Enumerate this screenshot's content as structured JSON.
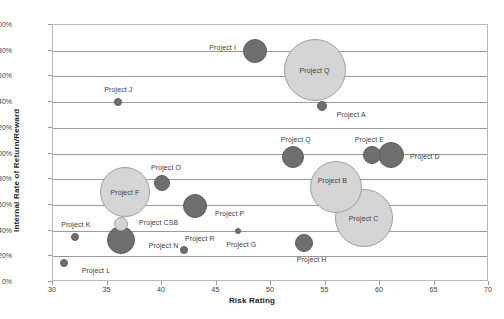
{
  "chart_data": {
    "type": "scatter",
    "title": "",
    "xlabel": "Risk Rating",
    "ylabel": "Internal Rate of Return/Reward",
    "xlim": [
      30,
      70
    ],
    "ylim": [
      0,
      200
    ],
    "xticks": [
      "30",
      "35",
      "40",
      "45",
      "50",
      "55",
      "60",
      "65",
      "70"
    ],
    "yticks": [
      "0%",
      "20%",
      "40%",
      "60%",
      "80%",
      "100%",
      "120%",
      "140%",
      "160%",
      "180%",
      "200%"
    ],
    "grid": "horizontal",
    "legend": "none",
    "colors": {
      "dark_bubble": "#6e6e6e",
      "light_bubble": "#d5d5d5",
      "gridline": "#9a9a9a",
      "frame": "#b9b9b9",
      "text": "#3c3c3c"
    },
    "points": [
      {
        "label": "Project I",
        "x": 48.5,
        "y": 180,
        "size": 24,
        "shade": "dark",
        "label_dx": -32,
        "label_dy": -4
      },
      {
        "label": "Project Q",
        "x": 54.0,
        "y": 165,
        "size": 62,
        "shade": "light",
        "label_dx": 0,
        "label_dy": 0
      },
      {
        "label": "Project J",
        "x": 36.0,
        "y": 140,
        "size": 8,
        "shade": "dark",
        "label_dx": 0,
        "label_dy": -13
      },
      {
        "label": "Project A",
        "x": 54.7,
        "y": 137,
        "size": 10,
        "shade": "dark",
        "label_dx": 29,
        "label_dy": 8
      },
      {
        "label": "Project Q",
        "x": 52.0,
        "y": 97,
        "size": 22,
        "shade": "dark",
        "label_dx": 3,
        "label_dy": -18
      },
      {
        "label": "Project E",
        "x": 59.3,
        "y": 99,
        "size": 18,
        "shade": "dark",
        "label_dx": -3,
        "label_dy": -16
      },
      {
        "label": "Project D",
        "x": 61.0,
        "y": 99,
        "size": 26,
        "shade": "dark",
        "label_dx": 34,
        "label_dy": 1
      },
      {
        "label": "Project B",
        "x": 56.0,
        "y": 74,
        "size": 52,
        "shade": "light",
        "label_dx": -4,
        "label_dy": -7
      },
      {
        "label": "Project C",
        "x": 58.5,
        "y": 50,
        "size": 58,
        "shade": "light",
        "label_dx": 0,
        "label_dy": 0
      },
      {
        "label": "Project F",
        "x": 36.6,
        "y": 70,
        "size": 50,
        "shade": "light",
        "label_dx": 0,
        "label_dy": 0
      },
      {
        "label": "Project O",
        "x": 40.0,
        "y": 77,
        "size": 16,
        "shade": "dark",
        "label_dx": 4,
        "label_dy": -16
      },
      {
        "label": "Project P",
        "x": 43.0,
        "y": 59,
        "size": 24,
        "shade": "dark",
        "label_dx": 35,
        "label_dy": 7
      },
      {
        "label": "Project CSB",
        "x": 36.2,
        "y": 45,
        "size": 14,
        "shade": "light",
        "label_dx": 38,
        "label_dy": -2
      },
      {
        "label": "Project N",
        "x": 36.2,
        "y": 33,
        "size": 28,
        "shade": "dark",
        "label_dx": 43,
        "label_dy": 5
      },
      {
        "label": "Project K",
        "x": 32.0,
        "y": 35,
        "size": 8,
        "shade": "dark",
        "label_dx": 1,
        "label_dy": -13
      },
      {
        "label": "Project L",
        "x": 31.0,
        "y": 15,
        "size": 8,
        "shade": "dark",
        "label_dx": 32,
        "label_dy": 7
      },
      {
        "label": "Project R",
        "x": 42.0,
        "y": 25,
        "size": 8,
        "shade": "dark",
        "label_dx": 16,
        "label_dy": -12
      },
      {
        "label": "Project G",
        "x": 47.0,
        "y": 40,
        "size": 6,
        "shade": "dark",
        "label_dx": 3,
        "label_dy": 13
      },
      {
        "label": "Project H",
        "x": 53.0,
        "y": 30,
        "size": 18,
        "shade": "dark",
        "label_dx": 8,
        "label_dy": 16
      }
    ]
  }
}
